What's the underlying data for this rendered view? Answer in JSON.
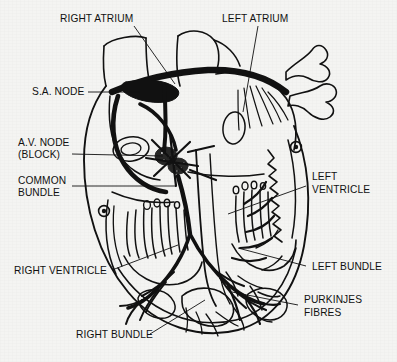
{
  "figure": {
    "background_color": "#f4f4f2",
    "ink_color": "#111111",
    "labels": [
      {
        "id": "right-atrium",
        "text": "RIGHT ATRIUM",
        "x": 60,
        "y": 22,
        "anchor": "start"
      },
      {
        "id": "left-atrium",
        "text": "LEFT ATRIUM",
        "x": 222,
        "y": 22,
        "anchor": "start"
      },
      {
        "id": "sa-node",
        "text": "S.A. NODE",
        "x": 32,
        "y": 95,
        "anchor": "start"
      },
      {
        "id": "av-node-1",
        "text": "A.V. NODE",
        "x": 18,
        "y": 146,
        "anchor": "start"
      },
      {
        "id": "av-node-2",
        "text": "(BLOCK)",
        "x": 18,
        "y": 158,
        "anchor": "start"
      },
      {
        "id": "common-bundle-1",
        "text": "COMMON",
        "x": 18,
        "y": 184,
        "anchor": "start"
      },
      {
        "id": "common-bundle-2",
        "text": "BUNDLE",
        "x": 18,
        "y": 196,
        "anchor": "start"
      },
      {
        "id": "left-ventricle-1",
        "text": "LEFT",
        "x": 312,
        "y": 180,
        "anchor": "start"
      },
      {
        "id": "left-ventricle-2",
        "text": "VENTRICLE",
        "x": 312,
        "y": 193,
        "anchor": "start"
      },
      {
        "id": "right-ventricle",
        "text": "RIGHT VENTRICLE",
        "x": 14,
        "y": 274,
        "anchor": "start"
      },
      {
        "id": "left-bundle",
        "text": "LEFT BUNDLE",
        "x": 312,
        "y": 270,
        "anchor": "start"
      },
      {
        "id": "purkinjes-1",
        "text": "PURKINJES",
        "x": 304,
        "y": 303,
        "anchor": "start"
      },
      {
        "id": "purkinjes-2",
        "text": "FIBRES",
        "x": 304,
        "y": 316,
        "anchor": "start"
      },
      {
        "id": "right-bundle",
        "text": "RIGHT BUNDLE",
        "x": 76,
        "y": 338,
        "anchor": "start"
      }
    ],
    "leader_lines": [
      {
        "id": "leader-right-atrium",
        "d": "M 134 26 L 175 84"
      },
      {
        "id": "leader-left-atrium",
        "d": "M 258 26 L 243 112"
      },
      {
        "id": "leader-sa-node",
        "d": "M 88 92 L 140 92"
      },
      {
        "id": "leader-av-node",
        "d": "M 72 154 L 163 156"
      },
      {
        "id": "leader-common-bundle",
        "d": "M 72 186 L 176 186"
      },
      {
        "id": "leader-left-ventricle",
        "d": "M 306 186 L 228 214"
      },
      {
        "id": "leader-right-ventricle",
        "d": "M 112 270 L 178 245"
      },
      {
        "id": "leader-left-bundle",
        "d": "M 306 266 L 238 248"
      },
      {
        "id": "leader-purkinjes",
        "d": "M 298 305 L 232 292"
      },
      {
        "id": "leader-right-bundle",
        "d": "M 150 334 L 205 300"
      }
    ],
    "anatomy": {
      "sa_node": {
        "name": "sino-atrial node",
        "type": "solid-dark-mass"
      },
      "av_node": {
        "name": "atrio-ventricular node",
        "type": "stippled-dark-mass"
      },
      "common_bundle": {
        "name": "bundle of His"
      },
      "right_bundle": {
        "name": "right bundle branch"
      },
      "left_bundle": {
        "name": "left bundle branch"
      },
      "purkinje_fibres": {
        "name": "purkinje fibre network"
      },
      "vessels": [
        "superior vena cava",
        "aorta",
        "pulmonary artery",
        "pulmonary veins"
      ]
    }
  }
}
